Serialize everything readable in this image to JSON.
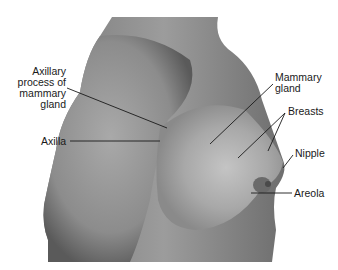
{
  "figure": {
    "labels": [
      {
        "id": "axillary-process",
        "lines": [
          "Axillary",
          "process of",
          "mammary",
          "gland"
        ]
      },
      {
        "id": "axilla",
        "lines": [
          "Axilla"
        ]
      },
      {
        "id": "mammary-gland",
        "lines": [
          "Mammary",
          "gland"
        ]
      },
      {
        "id": "breasts",
        "lines": [
          "Breasts"
        ]
      },
      {
        "id": "nipple",
        "lines": [
          "Nipple"
        ]
      },
      {
        "id": "areola",
        "lines": [
          "Areola"
        ]
      }
    ]
  },
  "colors": {
    "background": "#ffffff",
    "skin_dark": "#5e5e5e",
    "skin_mid": "#8a8a8a",
    "skin_light": "#b8b8b8",
    "leader_line": "#1a1a1a",
    "text": "#1a1a1a"
  }
}
